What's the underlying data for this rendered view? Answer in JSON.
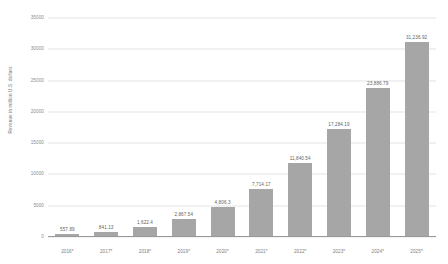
{
  "chart_data": {
    "type": "bar",
    "title": "",
    "subtitle": "",
    "xlabel": "",
    "ylabel": "Revenue in million U.S. dollars",
    "categories": [
      "2016*",
      "2017*",
      "2018*",
      "2019*",
      "2020*",
      "2021*",
      "2022*",
      "2023*",
      "2024*",
      "2025*"
    ],
    "values": [
      557.89,
      841.13,
      1622.4,
      2867.54,
      4806.3,
      7714.17,
      11840.54,
      17284.19,
      23886.79,
      31236.92
    ],
    "value_labels": [
      "557.89",
      "841.13",
      "1,622.4",
      "2,867.54",
      "4,806.3",
      "7,714.17",
      "11,840.54",
      "17,284.19",
      "23,886.79",
      "31,236.92"
    ],
    "ylim": [
      0,
      35000
    ],
    "yticks": [
      0,
      5000,
      10000,
      15000,
      20000,
      25000,
      30000,
      35000
    ],
    "ytick_labels": [
      "0",
      "5000",
      "10000",
      "15000",
      "20000",
      "25000",
      "30000",
      "35000"
    ],
    "grid": true,
    "legend": null,
    "bar_color": "#a6a6a6",
    "grid_color": "#e4e4e4",
    "axis_color": "#9a9a9a",
    "text_color": "#7d7d7d",
    "background": "#ffffff"
  }
}
